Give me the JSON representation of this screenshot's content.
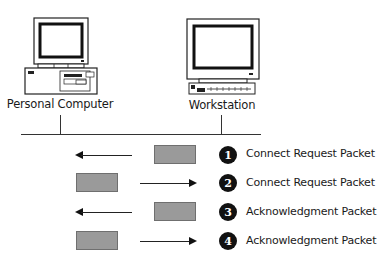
{
  "nodes": {
    "left": {
      "label": "Personal Computer",
      "icon": "desktop-computer-icon"
    },
    "right": {
      "label": "Workstation",
      "icon": "workstation-icon"
    }
  },
  "network": {
    "icon": "network-bus-line"
  },
  "steps": [
    {
      "number": "1",
      "label": "Connect Request Packet",
      "direction": "right-to-left"
    },
    {
      "number": "2",
      "label": "Connect Request Packet",
      "direction": "left-to-right"
    },
    {
      "number": "3",
      "label": "Acknowledgment Packet",
      "direction": "right-to-left"
    },
    {
      "number": "4",
      "label": "Acknowledgment Packet",
      "direction": "left-to-right"
    }
  ],
  "colors": {
    "packet_fill": "#9a9a9a",
    "step_circle": "#111111",
    "line": "#333333"
  }
}
